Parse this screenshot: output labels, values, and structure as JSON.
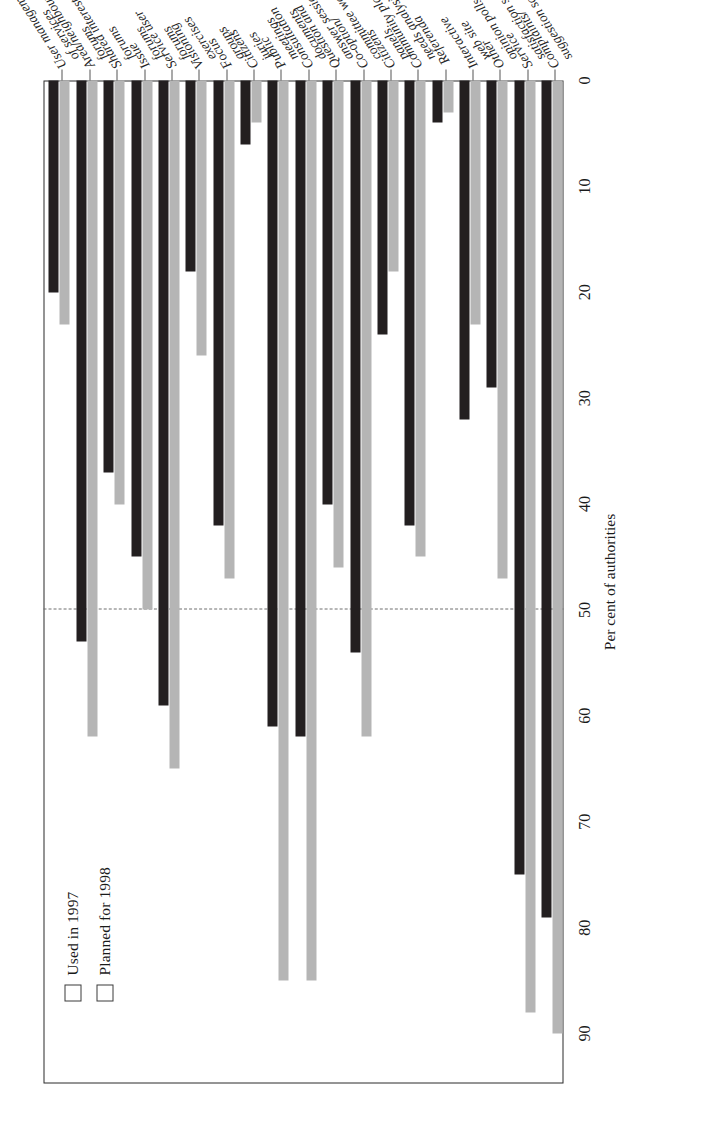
{
  "chart_data": {
    "type": "bar",
    "orientation": "horizontal",
    "title": "",
    "xlabel": "Per cent of authorities",
    "ylabel": "",
    "xlim": [
      0,
      90
    ],
    "xticks": [
      0,
      10,
      20,
      30,
      40,
      50,
      60,
      70,
      80,
      90
    ],
    "xtick_labels": [
      "0",
      "10",
      "20",
      "30",
      "40",
      "50",
      "60",
      "70",
      "80",
      "90"
    ],
    "grid": false,
    "reference_line": 50,
    "legend_position": "top-left",
    "legend": [
      "Used in 1997",
      "Planned for 1998"
    ],
    "categories": [
      "User management\nof services",
      "Area/neighbourhood\nforums",
      "Shared interest\nforums",
      "Issue\nforums",
      "Service user\nforums",
      "Visioning\nexercises",
      "Focus\ngroups",
      "Citizens'\njuries",
      "Public\nmeetings",
      "Consultation\ndocuments",
      "Question and\nanswer sessions",
      "Co-option/\ncommittee work",
      "Citizens'\npanels",
      "Community plan/\nneeds analysis",
      "Referenda",
      "Interactive\nweb site",
      "Other\nopinion polls",
      "Service\nsatisfaction surveys",
      "Complaints/\nsuggestion schemes"
    ],
    "series": [
      {
        "name": "Used in 1997",
        "color": "#b5b5b5",
        "values": [
          23,
          62,
          40,
          50,
          65,
          26,
          47,
          4,
          85,
          85,
          46,
          62,
          18,
          45,
          3,
          23,
          47,
          88,
          90
        ]
      },
      {
        "name": "Planned for 1998",
        "color": "#231f20",
        "values": [
          20,
          53,
          37,
          45,
          59,
          18,
          42,
          6,
          61,
          62,
          40,
          54,
          24,
          42,
          4,
          32,
          29,
          75,
          79
        ]
      }
    ]
  },
  "axis": {
    "value_axis_title": "Per cent of authorities"
  }
}
